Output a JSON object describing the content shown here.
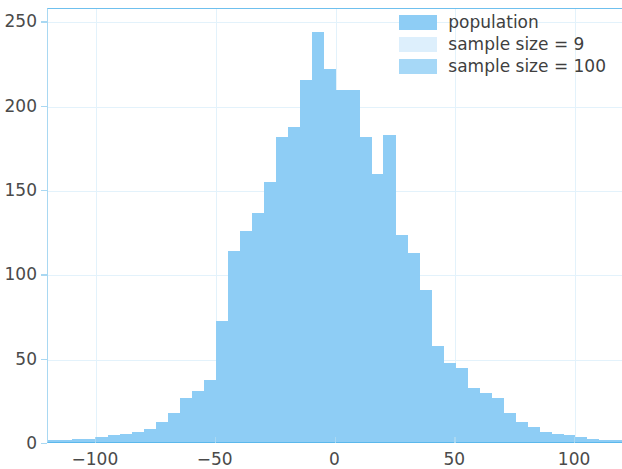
{
  "chart_data": {
    "type": "bar",
    "title": "",
    "xlabel": "",
    "ylabel": "",
    "xlim": [
      -120,
      120
    ],
    "ylim": [
      0,
      258
    ],
    "grid": true,
    "legend_position": "upper right",
    "bin_width": 5,
    "x_ticks": [
      -100,
      -50,
      0,
      50,
      100
    ],
    "y_ticks": [
      0,
      50,
      100,
      150,
      200,
      250
    ],
    "x_tick_labels": [
      "−100",
      "−50",
      "0",
      "50",
      "100"
    ],
    "y_tick_labels": [
      "0",
      "50",
      "100",
      "150",
      "200",
      "250"
    ],
    "legend": [
      {
        "label": "population",
        "color": "#8ecdf5"
      },
      {
        "label": "sample size = 9",
        "color": "#ddeffc"
      },
      {
        "label": "sample size = 100",
        "color": "#a6d8f7"
      }
    ],
    "series": [
      {
        "name": "population",
        "color": "#8ecdf5",
        "bin_centers": [
          -117.5,
          -112.5,
          -107.5,
          -102.5,
          -97.5,
          -92.5,
          -87.5,
          -82.5,
          -77.5,
          -72.5,
          -67.5,
          -62.5,
          -57.5,
          -52.5,
          -47.5,
          -42.5,
          -37.5,
          -32.5,
          -27.5,
          -22.5,
          -17.5,
          -12.5,
          -7.5,
          -2.5,
          2.5,
          7.5,
          12.5,
          17.5,
          22.5,
          27.5,
          32.5,
          37.5,
          42.5,
          47.5,
          52.5,
          57.5,
          62.5,
          67.5,
          72.5,
          77.5,
          82.5,
          87.5,
          92.5,
          97.5,
          102.5,
          107.5,
          112.5,
          117.5
        ],
        "values": [
          1,
          1,
          2,
          2,
          3,
          4,
          5,
          6,
          8,
          12,
          17,
          26,
          30,
          37,
          72,
          113,
          125,
          136,
          154,
          181,
          187,
          215,
          243,
          221,
          209,
          209,
          181,
          159,
          182,
          123,
          112,
          90,
          57,
          47,
          44,
          32,
          29,
          26,
          17,
          12,
          9,
          6,
          5,
          4,
          3,
          2,
          1,
          1
        ]
      }
    ]
  }
}
